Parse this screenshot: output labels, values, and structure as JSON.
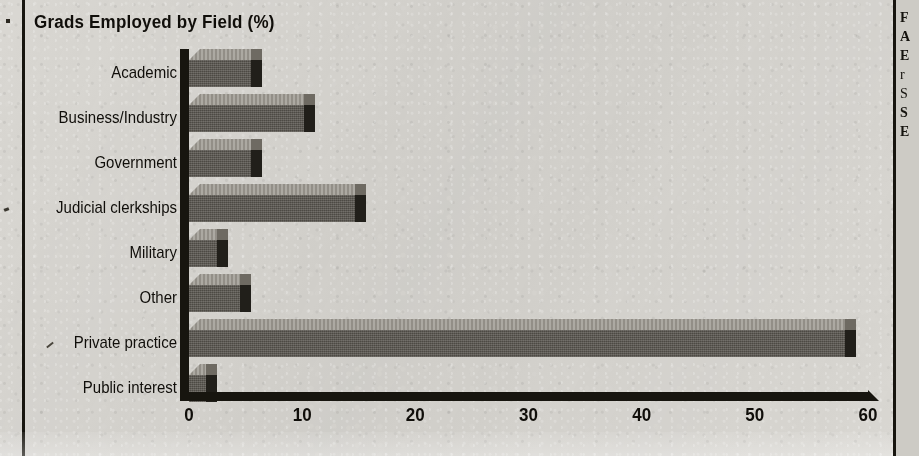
{
  "chart_data": {
    "type": "bar",
    "orientation": "horizontal",
    "title": "Grads Employed by Field (%)",
    "xlabel": "",
    "ylabel": "",
    "categories": [
      "Academic",
      "Business/Industry",
      "Government",
      "Judicial clerkships",
      "Military",
      "Other",
      "Private practice",
      "Public interest"
    ],
    "values": [
      5.5,
      10.2,
      5.5,
      14.7,
      2.5,
      4.5,
      58.0,
      1.5
    ],
    "xlim": [
      0,
      60
    ],
    "xticks": [
      0,
      10,
      20,
      30,
      40,
      50,
      60
    ],
    "xtick_labels": [
      "0",
      "10",
      "20",
      "30",
      "40",
      "50",
      "60"
    ],
    "grid": false,
    "legend": false,
    "style": "3d-shaded-bars",
    "colors": {
      "bar_face": "#56534c",
      "bar_top": "#9a968e",
      "bar_side": "#211f1a",
      "axis": "#17150f",
      "text": "#100e0a",
      "background": "#d9d7d2"
    }
  },
  "right_column": {
    "lines": [
      "F",
      "A",
      "E",
      "r",
      "S",
      "S",
      "E"
    ]
  }
}
